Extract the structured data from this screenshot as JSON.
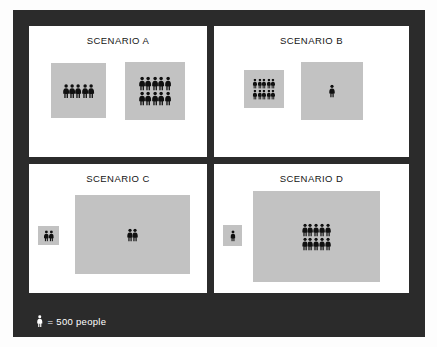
{
  "figure": {
    "frame_color": "#2b2b2b",
    "panel_bg": "#ffffff",
    "region_color": "#c2c2c2",
    "person_color": "#101010"
  },
  "legend": {
    "icon": "person-pictogram-icon",
    "label": "= 500 people",
    "unit_value": 500,
    "unit_noun": "people",
    "text_color": "#ffffff"
  },
  "chart_data": {
    "type": "pictogram",
    "title": "",
    "legend": {
      "symbol": "person",
      "value_per_symbol": 500,
      "unit": "people",
      "text": "= 500 people"
    },
    "panels": [
      {
        "id": "a",
        "label": "SCENARIO A",
        "groups": [
          {
            "name": "left-region",
            "symbols": 5,
            "value": 2500,
            "rows": [
              5
            ],
            "area_w": 55,
            "area_h": 55
          },
          {
            "name": "right-region",
            "symbols": 10,
            "value": 5000,
            "rows": [
              5,
              5
            ],
            "area_w": 60,
            "area_h": 58
          }
        ]
      },
      {
        "id": "b",
        "label": "SCENARIO B",
        "groups": [
          {
            "name": "left-region",
            "symbols": 10,
            "value": 5000,
            "rows": [
              5,
              5
            ],
            "area_w": 40,
            "area_h": 38
          },
          {
            "name": "right-region",
            "symbols": 1,
            "value": 500,
            "rows": [
              1
            ],
            "area_w": 62,
            "area_h": 58
          }
        ]
      },
      {
        "id": "c",
        "label": "SCENARIO C",
        "groups": [
          {
            "name": "left-region",
            "symbols": 2,
            "value": 1000,
            "rows": [
              2
            ],
            "area_w": 21,
            "area_h": 19
          },
          {
            "name": "right-region",
            "symbols": 2,
            "value": 1000,
            "rows": [
              2
            ],
            "area_w": 115,
            "area_h": 79
          }
        ]
      },
      {
        "id": "d",
        "label": "SCENARIO D",
        "groups": [
          {
            "name": "left-region",
            "symbols": 1,
            "value": 500,
            "rows": [
              1
            ],
            "area_w": 19,
            "area_h": 21
          },
          {
            "name": "right-region",
            "symbols": 10,
            "value": 5000,
            "rows": [
              5,
              5
            ],
            "area_w": 127,
            "area_h": 91
          }
        ]
      }
    ]
  }
}
